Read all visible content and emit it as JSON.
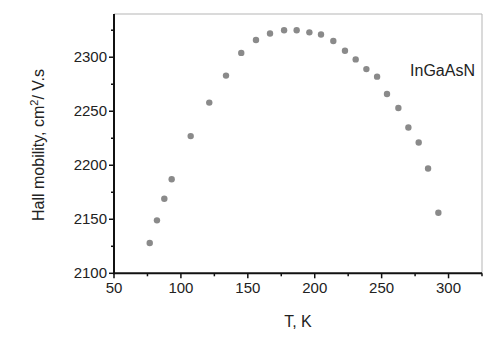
{
  "chart_data": {
    "type": "scatter",
    "title": "",
    "xlabel": "T, K",
    "ylabel": "Hall mobility, cm²/ V.s",
    "xlim": [
      50,
      325
    ],
    "ylim": [
      2100,
      2340
    ],
    "xticks": [
      50,
      100,
      150,
      200,
      250,
      300
    ],
    "yticks": [
      2100,
      2150,
      2200,
      2250,
      2300
    ],
    "x_minor_step": 25,
    "y_minor_step": 25,
    "grid": false,
    "legend": null,
    "annotations": [
      {
        "text": "InGaAsN",
        "x": 302,
        "y": 2308
      }
    ],
    "marker_color": "#8a8a8a",
    "series": [
      {
        "name": "InGaAsN",
        "x": [
          76.7,
          82.1,
          87.6,
          93.1,
          107.3,
          121.2,
          133.7,
          145.1,
          156.1,
          166.6,
          177.1,
          186.5,
          196.0,
          204.7,
          213.9,
          222.6,
          230.6,
          238.6,
          246.6,
          254.0,
          262.5,
          270.0,
          277.7,
          284.7,
          292.4
        ],
        "y": [
          2128,
          2149,
          2169,
          2187,
          2227,
          2258,
          2283,
          2304,
          2316,
          2322,
          2325,
          2325,
          2323,
          2321,
          2315,
          2306,
          2298,
          2289,
          2282,
          2266,
          2253,
          2235,
          2221,
          2197,
          2156
        ]
      }
    ]
  }
}
